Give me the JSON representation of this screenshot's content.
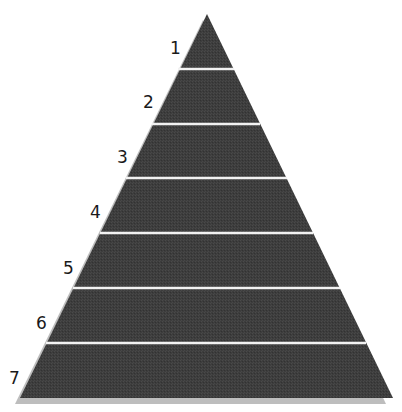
{
  "diagram": {
    "type": "pyramid",
    "levels": [
      {
        "label": "1"
      },
      {
        "label": "2"
      },
      {
        "label": "3"
      },
      {
        "label": "4"
      },
      {
        "label": "5"
      },
      {
        "label": "6"
      },
      {
        "label": "7"
      }
    ],
    "colors": {
      "fill": "#3c3c3c",
      "divider": "#f2f2f2",
      "shadow": "#b8b8b8"
    }
  }
}
